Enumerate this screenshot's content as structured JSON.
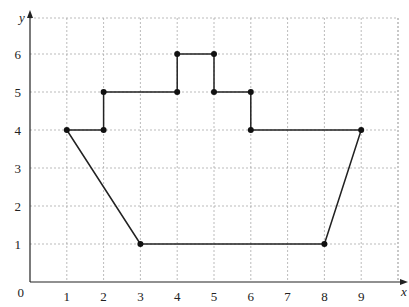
{
  "diagram": {
    "type": "coordinate-grid-polygon",
    "axes": {
      "x_label": "x",
      "y_label": "y",
      "origin_label": "0",
      "x_ticks": [
        "1",
        "2",
        "3",
        "4",
        "5",
        "6",
        "7",
        "8",
        "9"
      ],
      "y_ticks": [
        "1",
        "2",
        "3",
        "4",
        "5",
        "6"
      ],
      "x_range": [
        0,
        10
      ],
      "y_range": [
        0,
        7
      ]
    },
    "grid": {
      "on": true,
      "style": "dashed",
      "color": "#aaaaaa"
    },
    "shape": {
      "name": "boat",
      "vertices": [
        [
          1,
          4
        ],
        [
          2,
          4
        ],
        [
          2,
          5
        ],
        [
          4,
          5
        ],
        [
          4,
          6
        ],
        [
          5,
          6
        ],
        [
          5,
          5
        ],
        [
          6,
          5
        ],
        [
          6,
          4
        ],
        [
          9,
          4
        ],
        [
          8,
          1
        ],
        [
          3,
          1
        ]
      ],
      "closed": true,
      "stroke_color": "#222222",
      "point_color": "#111111"
    }
  }
}
